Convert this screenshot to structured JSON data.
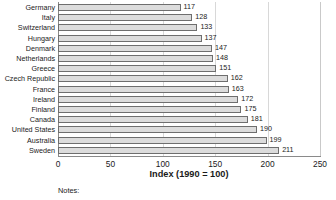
{
  "chart_data": {
    "type": "bar",
    "orientation": "horizontal",
    "title": "",
    "subtitle": "",
    "xlabel": "Index (1990 = 100)",
    "ylabel": "",
    "xlim": [
      0,
      250
    ],
    "xticks": [
      0,
      50,
      100,
      150,
      200,
      250
    ],
    "xtick_labels": [
      "0",
      "50",
      "100",
      "150",
      "200",
      "250"
    ],
    "grid": true,
    "grid_axis": "x",
    "legend": false,
    "legend_position": "none",
    "categories": [
      "Germany",
      "Italy",
      "Switzerland",
      "Hungary",
      "Denmark",
      "Netherlands",
      "Greece",
      "Czech Republic",
      "France",
      "Ireland",
      "Finland",
      "Canada",
      "United States",
      "Australia",
      "Sweden"
    ],
    "values": [
      117,
      128,
      133,
      137,
      147,
      148,
      151,
      162,
      163,
      172,
      175,
      181,
      190,
      199,
      211
    ],
    "value_labels": [
      "117",
      "128",
      "133",
      "137",
      "147",
      "148",
      "151",
      "162",
      "163",
      "172",
      "175",
      "181",
      "190",
      "199",
      "211"
    ],
    "bar_fill_color": "#dcdcdc",
    "bar_edge_color": "#6e6e6e",
    "grid_color": "#d8d8d8",
    "axis_color": "#8a8a8a",
    "text_color": "#1a1a1a"
  },
  "footer": {
    "notes_label": "Notes:"
  }
}
